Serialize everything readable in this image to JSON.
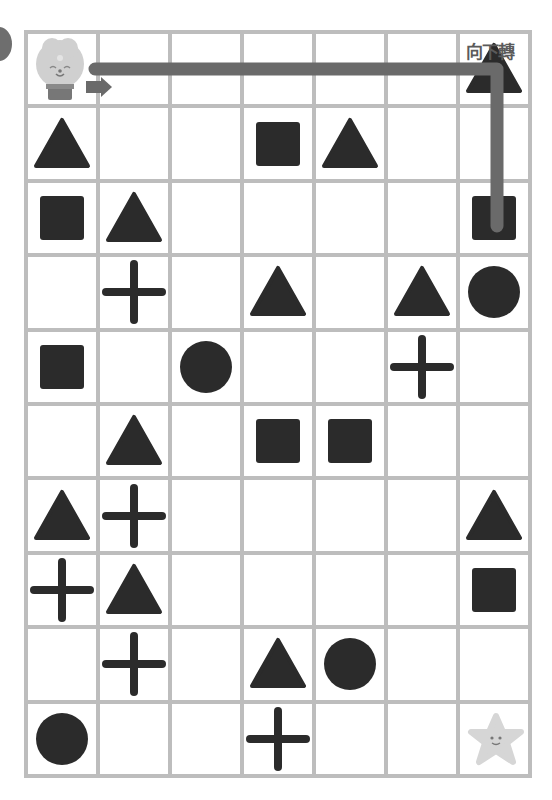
{
  "puzzle": {
    "instruction_label": "向下轉",
    "start": {
      "row": 0,
      "col": 0,
      "character": "lion"
    },
    "goal": {
      "row": 9,
      "col": 6,
      "character": "starfish"
    },
    "path_color": "#6a6a6a",
    "shape_color": "#2b2b2b",
    "grid_line_color": "#bdbdbd",
    "rows": 10,
    "cols": 7,
    "grid": [
      [
        "lion",
        "",
        "",
        "",
        "",
        "",
        "triangle"
      ],
      [
        "triangle",
        "",
        "",
        "square",
        "triangle",
        "",
        ""
      ],
      [
        "square",
        "triangle",
        "",
        "",
        "",
        "",
        "square"
      ],
      [
        "",
        "cross",
        "",
        "triangle",
        "",
        "triangle",
        "circle"
      ],
      [
        "square",
        "",
        "circle",
        "",
        "",
        "cross",
        ""
      ],
      [
        "",
        "triangle",
        "",
        "square",
        "square",
        "",
        ""
      ],
      [
        "triangle",
        "cross",
        "",
        "",
        "",
        "",
        "triangle"
      ],
      [
        "cross",
        "triangle",
        "",
        "",
        "",
        "",
        "square"
      ],
      [
        "",
        "cross",
        "",
        "triangle",
        "circle",
        "",
        ""
      ],
      [
        "circle",
        "",
        "",
        "cross",
        "",
        "",
        "star"
      ]
    ]
  }
}
